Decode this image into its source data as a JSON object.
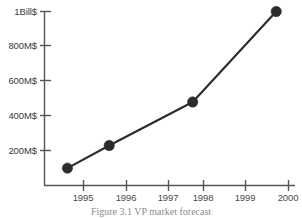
{
  "figure": {
    "caption": "Figure 3.1   VP market forecast"
  },
  "chart_data": {
    "type": "line",
    "title": "",
    "xlabel": "",
    "ylabel": "",
    "x": [
      1995,
      1996,
      1998,
      2000
    ],
    "values": [
      100,
      230,
      480,
      1000
    ],
    "value_unit": "M$",
    "categories": [
      "1995",
      "1996",
      "1998",
      "2000"
    ],
    "xtick_labels": [
      "1995",
      "1996",
      "1997",
      "1998",
      "1999",
      "2000"
    ],
    "xtick_values": [
      1995,
      1996,
      1997,
      1998,
      1999,
      2000
    ],
    "ytick_labels": [
      "200M$",
      "400M$",
      "600M$",
      "800M$",
      "1Bill$"
    ],
    "ytick_values": [
      200,
      400,
      600,
      800,
      1000
    ],
    "xlim": [
      1994.45,
      2000.45
    ],
    "ylim": [
      0,
      1000
    ],
    "grid": false,
    "legend": false,
    "marker": "circle",
    "line_color": "#2b2b2b",
    "marker_color": "#2b2b2b",
    "axis_color": "#555555",
    "background_color": "#ffffff"
  }
}
